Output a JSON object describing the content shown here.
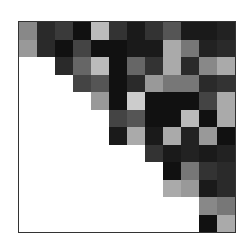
{
  "chart_data": {
    "type": "heatmap",
    "title": "",
    "xlabel": "",
    "ylabel": "",
    "grid": false,
    "legend": null,
    "shape": "upper-triangular",
    "n_rows": 12,
    "n_cols": 12,
    "colormap": "grayscale (dark = high, light = low)",
    "row_start_col": [
      0,
      0,
      2,
      3,
      4,
      5,
      5,
      7,
      8,
      8,
      10,
      10
    ],
    "values": [
      [
        "#888888",
        "#2a2a2a",
        "#3a3a3a",
        "#111111",
        "#bbbbbb",
        "#333333",
        "#1a1a1a",
        "#333333",
        "#555555",
        "#1a1a1a",
        "#1a1a1a",
        "#222222"
      ],
      [
        "#999999",
        "#2a2a2a",
        "#111111",
        "#444444",
        "#111111",
        "#111111",
        "#1a1a1a",
        "#1a1a1a",
        "#aaaaaa",
        "#777777",
        "#222222",
        "#2a2a2a"
      ],
      [
        null,
        null,
        "#2a2a2a",
        "#666666",
        "#bbbbbb",
        "#111111",
        "#666666",
        "#333333",
        "#aaaaaa",
        "#2a2a2a",
        "#888888",
        "#aaaaaa"
      ],
      [
        null,
        null,
        null,
        "#444444",
        "#555555",
        "#111111",
        "#2a2a2a",
        "#999999",
        "#777777",
        "#777777",
        "#2a2a2a",
        "#333333"
      ],
      [
        null,
        null,
        null,
        null,
        "#999999",
        "#111111",
        "#cccccc",
        "#111111",
        "#111111",
        "#111111",
        "#444444",
        "#aaaaaa"
      ],
      [
        null,
        null,
        null,
        null,
        null,
        "#444444",
        "#555555",
        "#111111",
        "#111111",
        "#bbbbbb",
        "#111111",
        "#aaaaaa"
      ],
      [
        null,
        null,
        null,
        null,
        null,
        "#1a1a1a",
        "#aaaaaa",
        "#1a1a1a",
        "#aaaaaa",
        "#222222",
        "#999999",
        "#111111"
      ],
      [
        null,
        null,
        null,
        null,
        null,
        null,
        null,
        "#333333",
        "#1a1a1a",
        "#222222",
        "#1a1a1a",
        "#222222"
      ],
      [
        null,
        null,
        null,
        null,
        null,
        null,
        null,
        null,
        "#111111",
        "#777777",
        "#333333",
        "#2a2a2a"
      ],
      [
        null,
        null,
        null,
        null,
        null,
        null,
        null,
        null,
        "#aaaaaa",
        "#999999",
        "#1a1a1a",
        "#2a2a2a"
      ],
      [
        null,
        null,
        null,
        null,
        null,
        null,
        null,
        null,
        null,
        null,
        "#888888",
        "#777777"
      ],
      [
        null,
        null,
        null,
        null,
        null,
        null,
        null,
        null,
        null,
        null,
        "#111111",
        "#aaaaaa"
      ]
    ]
  },
  "colors": {
    "background": "#ffffff",
    "frame_border": "#333333",
    "empty_cell": "#ffffff"
  }
}
